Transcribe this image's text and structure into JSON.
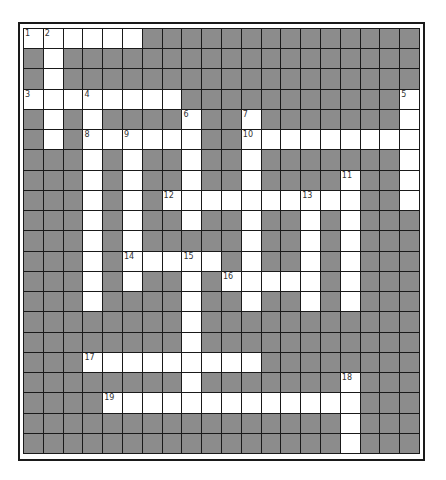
{
  "puzzle": {
    "type": "crossword",
    "cols": 20,
    "rows": 21,
    "colors": {
      "block": "#8c8c8c",
      "open": "#ffffff",
      "grid_line": "#1a1a1a",
      "number_text": "#333333"
    },
    "white_cells": [
      [
        0,
        0
      ],
      [
        0,
        1
      ],
      [
        0,
        2
      ],
      [
        0,
        3
      ],
      [
        0,
        4
      ],
      [
        0,
        5
      ],
      [
        1,
        1
      ],
      [
        2,
        1
      ],
      [
        3,
        0
      ],
      [
        3,
        1
      ],
      [
        3,
        2
      ],
      [
        3,
        3
      ],
      [
        3,
        4
      ],
      [
        3,
        5
      ],
      [
        3,
        6
      ],
      [
        3,
        7
      ],
      [
        3,
        19
      ],
      [
        4,
        1
      ],
      [
        4,
        3
      ],
      [
        4,
        8
      ],
      [
        4,
        11
      ],
      [
        4,
        19
      ],
      [
        5,
        1
      ],
      [
        5,
        3
      ],
      [
        5,
        4
      ],
      [
        5,
        5
      ],
      [
        5,
        6
      ],
      [
        5,
        7
      ],
      [
        5,
        8
      ],
      [
        5,
        11
      ],
      [
        5,
        12
      ],
      [
        5,
        13
      ],
      [
        5,
        14
      ],
      [
        5,
        15
      ],
      [
        5,
        16
      ],
      [
        5,
        17
      ],
      [
        5,
        18
      ],
      [
        5,
        19
      ],
      [
        6,
        3
      ],
      [
        6,
        5
      ],
      [
        6,
        8
      ],
      [
        6,
        11
      ],
      [
        6,
        19
      ],
      [
        7,
        3
      ],
      [
        7,
        5
      ],
      [
        7,
        8
      ],
      [
        7,
        11
      ],
      [
        7,
        16
      ],
      [
        7,
        19
      ],
      [
        8,
        3
      ],
      [
        8,
        5
      ],
      [
        8,
        7
      ],
      [
        8,
        8
      ],
      [
        8,
        9
      ],
      [
        8,
        10
      ],
      [
        8,
        11
      ],
      [
        8,
        12
      ],
      [
        8,
        13
      ],
      [
        8,
        14
      ],
      [
        8,
        15
      ],
      [
        8,
        16
      ],
      [
        8,
        19
      ],
      [
        9,
        3
      ],
      [
        9,
        5
      ],
      [
        9,
        8
      ],
      [
        9,
        11
      ],
      [
        9,
        14
      ],
      [
        9,
        16
      ],
      [
        10,
        3
      ],
      [
        10,
        5
      ],
      [
        10,
        11
      ],
      [
        10,
        14
      ],
      [
        10,
        16
      ],
      [
        11,
        3
      ],
      [
        11,
        5
      ],
      [
        11,
        6
      ],
      [
        11,
        7
      ],
      [
        11,
        8
      ],
      [
        11,
        9
      ],
      [
        11,
        11
      ],
      [
        11,
        14
      ],
      [
        11,
        16
      ],
      [
        12,
        3
      ],
      [
        12,
        5
      ],
      [
        12,
        8
      ],
      [
        12,
        10
      ],
      [
        12,
        11
      ],
      [
        12,
        12
      ],
      [
        12,
        13
      ],
      [
        12,
        14
      ],
      [
        12,
        16
      ],
      [
        13,
        3
      ],
      [
        13,
        8
      ],
      [
        13,
        11
      ],
      [
        13,
        14
      ],
      [
        13,
        16
      ],
      [
        14,
        8
      ],
      [
        15,
        8
      ],
      [
        16,
        3
      ],
      [
        16,
        4
      ],
      [
        16,
        5
      ],
      [
        16,
        6
      ],
      [
        16,
        7
      ],
      [
        16,
        8
      ],
      [
        16,
        9
      ],
      [
        16,
        10
      ],
      [
        16,
        11
      ],
      [
        17,
        8
      ],
      [
        17,
        16
      ],
      [
        18,
        4
      ],
      [
        18,
        5
      ],
      [
        18,
        6
      ],
      [
        18,
        7
      ],
      [
        18,
        8
      ],
      [
        18,
        9
      ],
      [
        18,
        10
      ],
      [
        18,
        11
      ],
      [
        18,
        12
      ],
      [
        18,
        13
      ],
      [
        18,
        14
      ],
      [
        18,
        15
      ],
      [
        18,
        16
      ],
      [
        19,
        16
      ],
      [
        20,
        16
      ]
    ],
    "numbers": [
      {
        "label": "1",
        "row": 0,
        "col": 0
      },
      {
        "label": "2",
        "row": 0,
        "col": 1
      },
      {
        "label": "3",
        "row": 3,
        "col": 0
      },
      {
        "label": "4",
        "row": 3,
        "col": 3
      },
      {
        "label": "5",
        "row": 3,
        "col": 19
      },
      {
        "label": "6",
        "row": 4,
        "col": 8
      },
      {
        "label": "7",
        "row": 4,
        "col": 11
      },
      {
        "label": "8",
        "row": 5,
        "col": 3
      },
      {
        "label": "9",
        "row": 5,
        "col": 5
      },
      {
        "label": "10",
        "row": 5,
        "col": 11
      },
      {
        "label": "11",
        "row": 7,
        "col": 16
      },
      {
        "label": "12",
        "row": 8,
        "col": 7
      },
      {
        "label": "13",
        "row": 8,
        "col": 14
      },
      {
        "label": "14",
        "row": 11,
        "col": 5
      },
      {
        "label": "15",
        "row": 11,
        "col": 8
      },
      {
        "label": "16",
        "row": 12,
        "col": 10
      },
      {
        "label": "17",
        "row": 16,
        "col": 3
      },
      {
        "label": "18",
        "row": 17,
        "col": 16
      },
      {
        "label": "19",
        "row": 18,
        "col": 4
      }
    ],
    "entries": {
      "across": [
        {
          "number": "1",
          "row": 0,
          "col": 0,
          "length": 6
        },
        {
          "number": "3",
          "row": 3,
          "col": 0,
          "length": 8
        },
        {
          "number": "8",
          "row": 5,
          "col": 3,
          "length": 6
        },
        {
          "number": "10",
          "row": 5,
          "col": 11,
          "length": 9
        },
        {
          "number": "12",
          "row": 8,
          "col": 7,
          "length": 10
        },
        {
          "number": "14",
          "row": 11,
          "col": 5,
          "length": 5
        },
        {
          "number": "16",
          "row": 12,
          "col": 10,
          "length": 5
        },
        {
          "number": "17",
          "row": 16,
          "col": 3,
          "length": 9
        },
        {
          "number": "19",
          "row": 18,
          "col": 4,
          "length": 13
        }
      ],
      "down": [
        {
          "number": "2",
          "row": 0,
          "col": 1,
          "length": 6
        },
        {
          "number": "4",
          "row": 3,
          "col": 3,
          "length": 11
        },
        {
          "number": "5",
          "row": 3,
          "col": 19,
          "length": 6
        },
        {
          "number": "6",
          "row": 4,
          "col": 8,
          "length": 6
        },
        {
          "number": "7",
          "row": 4,
          "col": 11,
          "length": 10
        },
        {
          "number": "9",
          "row": 5,
          "col": 5,
          "length": 8
        },
        {
          "number": "11",
          "row": 7,
          "col": 16,
          "length": 7
        },
        {
          "number": "13",
          "row": 8,
          "col": 14,
          "length": 6
        },
        {
          "number": "15",
          "row": 11,
          "col": 8,
          "length": 8
        },
        {
          "number": "18",
          "row": 17,
          "col": 16,
          "length": 4
        }
      ]
    }
  }
}
